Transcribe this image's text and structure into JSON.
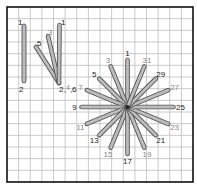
{
  "diagram": {
    "type": "embroidery-stitch-diagram",
    "grid": {
      "columns": 16,
      "rows": 15,
      "line_color": "#bdbdbd",
      "border_color": "#111111"
    },
    "stitch_colors": {
      "fill": "#bcbcbc",
      "outline": "#555555"
    },
    "label_colors": {
      "dark": "#222222",
      "light": "#888888"
    },
    "straight_stitch": {
      "labels": {
        "start": "1",
        "end": "2"
      }
    },
    "fan_stitch": {
      "labels": {
        "top_1": "1",
        "top_3": "3",
        "top_5": "5",
        "base_2": "2",
        "base_4": "4",
        "base_6": "6",
        "sep": ","
      }
    },
    "star_stitch": {
      "labels": [
        "1",
        "3",
        "5",
        "7",
        "9",
        "11",
        "13",
        "15",
        "17",
        "19",
        "21",
        "23",
        "25",
        "27",
        "29",
        "31"
      ],
      "label_tone": [
        "dark",
        "light",
        "dark",
        "light",
        "dark",
        "light",
        "dark",
        "light",
        "dark",
        "light",
        "dark",
        "light",
        "dark",
        "light",
        "dark",
        "light"
      ]
    }
  }
}
